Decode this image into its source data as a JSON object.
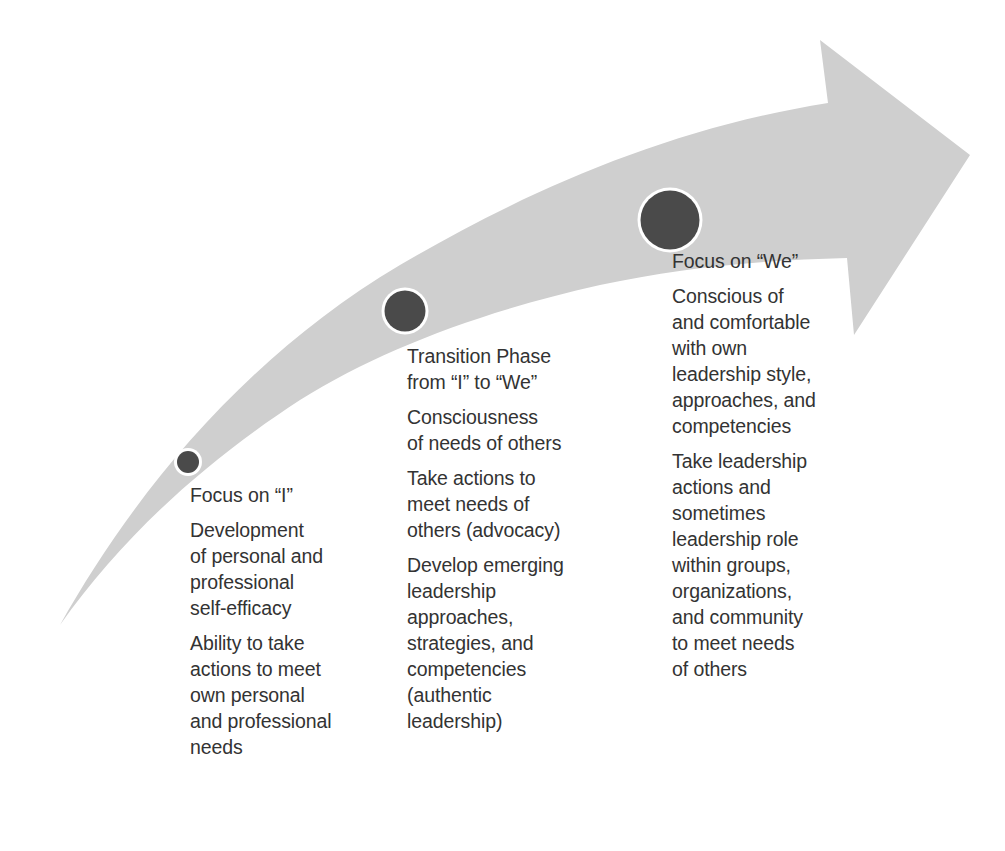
{
  "diagram": {
    "type": "curved-progression-arrow",
    "colors": {
      "arrow_fill": "#cfcfcf",
      "circle_fill": "#4a4a4a",
      "circle_ring": "#ffffff",
      "text": "#333333",
      "background": "#ffffff"
    },
    "stages": [
      {
        "heading": "Focus on “I”",
        "marker_size": "small",
        "paragraphs": [
          "Development\nof personal and\nprofessional\nself-efficacy",
          "Ability to take\nactions to meet\nown personal\nand professional\nneeds"
        ]
      },
      {
        "heading": "Transition Phase\nfrom “I” to “We”",
        "marker_size": "medium",
        "paragraphs": [
          "Consciousness\nof needs of others",
          "Take actions to\nmeet needs of\nothers (advocacy)",
          "Develop emerging\nleadership\napproaches,\nstrategies, and\ncompetencies\n(authentic\nleadership)"
        ]
      },
      {
        "heading": "Focus on “We”",
        "marker_size": "large",
        "paragraphs": [
          "Conscious of\nand comfortable\nwith own\nleadership style,\napproaches, and\ncompetencies",
          "Take leadership\nactions and\nsometimes\nleadership role\nwithin groups,\norganizations,\nand community\nto meet needs\nof others"
        ]
      }
    ]
  }
}
